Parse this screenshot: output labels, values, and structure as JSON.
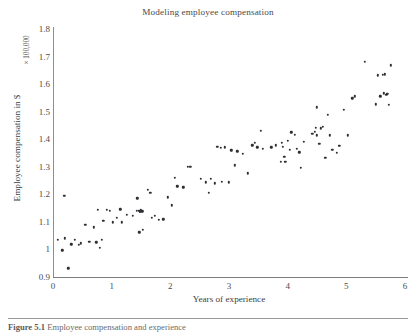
{
  "figure": {
    "caption_label": "Figure 5.1",
    "caption_text": "Employee compensation and experience"
  },
  "chart_data": {
    "type": "scatter",
    "title": "Modeling employee compensation",
    "xlabel": "Years of experience",
    "ylabel": "Employee compensation in $",
    "y_multiplier_label": "× 100,000",
    "xlim": [
      0,
      6
    ],
    "ylim": [
      0.9,
      1.8
    ],
    "xticks": [
      "0",
      "1",
      "2",
      "3",
      "4",
      "5",
      "6"
    ],
    "xtick_values": [
      0,
      1,
      2,
      3,
      4,
      5,
      6
    ],
    "yticks": [
      "0.9",
      "1",
      "1.1",
      "1.2",
      "1.3",
      "1.4",
      "1.5",
      "1.6",
      "1.7",
      "1.8"
    ],
    "ytick_values": [
      0.9,
      1.0,
      1.1,
      1.2,
      1.3,
      1.4,
      1.5,
      1.6,
      1.7,
      1.8
    ],
    "grid": false,
    "legend": false,
    "marker_color": "#2e2e33",
    "marker_size": 2.4,
    "series": [
      {
        "name": "employees",
        "points": [
          [
            0.08,
            1.034
          ],
          [
            0.16,
            0.997
          ],
          [
            0.19,
            1.194
          ],
          [
            0.2,
            1.04
          ],
          [
            0.26,
            0.932
          ],
          [
            0.31,
            1.019
          ],
          [
            0.37,
            1.036
          ],
          [
            0.44,
            1.016
          ],
          [
            0.47,
            1.022
          ],
          [
            0.55,
            1.09
          ],
          [
            0.62,
            1.027
          ],
          [
            0.7,
            1.08
          ],
          [
            0.74,
            1.026
          ],
          [
            0.76,
            1.143
          ],
          [
            0.8,
            1.007
          ],
          [
            0.83,
            1.036
          ],
          [
            0.86,
            1.104
          ],
          [
            0.92,
            1.143
          ],
          [
            0.97,
            1.141
          ],
          [
            1.02,
            1.098
          ],
          [
            1.09,
            1.114
          ],
          [
            1.15,
            1.145
          ],
          [
            1.17,
            1.098
          ],
          [
            1.26,
            1.126
          ],
          [
            1.36,
            1.122
          ],
          [
            1.43,
            1.141
          ],
          [
            1.46,
            1.14
          ],
          [
            1.48,
            1.139
          ],
          [
            1.49,
            1.136
          ],
          [
            1.5,
            1.143
          ],
          [
            1.52,
            1.139
          ],
          [
            1.44,
            1.186
          ],
          [
            1.53,
            1.072
          ],
          [
            1.47,
            1.062
          ],
          [
            1.62,
            1.216
          ],
          [
            1.66,
            1.205
          ],
          [
            1.68,
            1.115
          ],
          [
            1.74,
            1.123
          ],
          [
            1.8,
            1.108
          ],
          [
            1.88,
            1.11
          ],
          [
            1.96,
            1.189
          ],
          [
            2.02,
            1.16
          ],
          [
            2.08,
            1.259
          ],
          [
            2.12,
            1.229
          ],
          [
            2.22,
            1.225
          ],
          [
            2.3,
            1.301
          ],
          [
            2.34,
            1.299
          ],
          [
            2.52,
            1.257
          ],
          [
            2.6,
            1.243
          ],
          [
            2.66,
            1.205
          ],
          [
            2.69,
            1.256
          ],
          [
            2.76,
            1.24
          ],
          [
            2.8,
            1.372
          ],
          [
            2.86,
            1.368
          ],
          [
            2.88,
            1.246
          ],
          [
            2.93,
            1.371
          ],
          [
            3.0,
            1.244
          ],
          [
            3.04,
            1.36
          ],
          [
            3.1,
            1.305
          ],
          [
            3.14,
            1.356
          ],
          [
            3.24,
            1.348
          ],
          [
            3.32,
            1.276
          ],
          [
            3.4,
            1.378
          ],
          [
            3.44,
            1.386
          ],
          [
            3.48,
            1.37
          ],
          [
            3.54,
            1.43
          ],
          [
            3.58,
            1.365
          ],
          [
            3.72,
            1.371
          ],
          [
            3.8,
            1.378
          ],
          [
            3.88,
            1.317
          ],
          [
            3.9,
            1.388
          ],
          [
            3.92,
            1.372
          ],
          [
            3.94,
            1.337
          ],
          [
            3.96,
            1.318
          ],
          [
            4.0,
            1.394
          ],
          [
            4.04,
            1.362
          ],
          [
            4.06,
            1.425
          ],
          [
            4.12,
            1.417
          ],
          [
            4.16,
            1.366
          ],
          [
            4.2,
            1.352
          ],
          [
            4.22,
            1.296
          ],
          [
            4.28,
            1.39
          ],
          [
            4.42,
            1.42
          ],
          [
            4.46,
            1.427
          ],
          [
            4.48,
            1.441
          ],
          [
            4.5,
            1.414
          ],
          [
            4.5,
            1.516
          ],
          [
            4.54,
            1.383
          ],
          [
            4.56,
            1.44
          ],
          [
            4.6,
            1.446
          ],
          [
            4.64,
            1.333
          ],
          [
            4.68,
            1.488
          ],
          [
            4.72,
            1.414
          ],
          [
            4.76,
            1.361
          ],
          [
            4.84,
            1.35
          ],
          [
            4.88,
            1.377
          ],
          [
            4.96,
            1.507
          ],
          [
            5.02,
            1.414
          ],
          [
            5.1,
            1.548
          ],
          [
            5.14,
            1.556
          ],
          [
            5.32,
            1.68
          ],
          [
            5.5,
            1.527
          ],
          [
            5.54,
            1.632
          ],
          [
            5.58,
            1.556
          ],
          [
            5.62,
            1.634
          ],
          [
            5.64,
            1.566
          ],
          [
            5.66,
            1.636
          ],
          [
            5.68,
            1.562
          ],
          [
            5.7,
            1.564
          ],
          [
            5.72,
            1.525
          ],
          [
            5.76,
            1.668
          ]
        ]
      }
    ]
  }
}
